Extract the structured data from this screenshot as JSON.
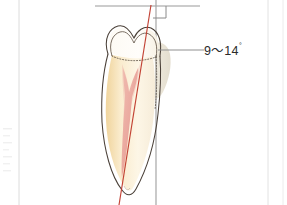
{
  "figure": {
    "name": "tooth-axis-inclination-diagram",
    "background_color": "#ffffff",
    "width": 287,
    "height": 205,
    "annotation": {
      "angle_label": "9〜14",
      "degree_symbol": "°",
      "label_full": "9〜14°"
    },
    "colors": {
      "occlusal_plane_line": "#9a9a9a",
      "vertical_reference_line": "#a0a0a0",
      "tooth_axis_line": "#c0392b",
      "tooth_outline": "#4a4038",
      "enamel_fill": "#fdf6ec",
      "dentin_fill": "#f6e0b4",
      "root_fill": "#fbefd6",
      "pulp_fill": "#e8a7a0",
      "pulp_canal": "#d98b85",
      "cej_dotted": "#6b5f52",
      "shadow_fill": "#e2dccd",
      "label_text": "#2b2b2b",
      "leader_line": "#8f8f8f",
      "page_margin_line": "#d8d8d8"
    },
    "elements": {
      "occlusal_plane": "horizontal-reference-line",
      "vertical_reference": "vertical-reference-line",
      "tooth_axis": "long-axis-line",
      "right_angle_marker": "perpendicular-square-marker",
      "leader": "label-leader-line",
      "tooth": "maxillary-incisor-cross-section",
      "enamel": "enamel-cap",
      "dentin": "dentin-body",
      "pulp": "pulp-chamber-and-canal",
      "cej": "cemento-enamel-junction-dotted"
    },
    "geometry": {
      "occlusal_plane_y": 6,
      "occlusal_plane_x1": 95,
      "occlusal_plane_x2": 200,
      "vertical_line_x": 156,
      "axis_top": [
        151,
        6
      ],
      "axis_bottom": [
        120,
        205
      ],
      "label_x": 205,
      "label_y": 51,
      "leader_x1": 160,
      "leader_x2": 203,
      "leader_y": 50
    }
  }
}
